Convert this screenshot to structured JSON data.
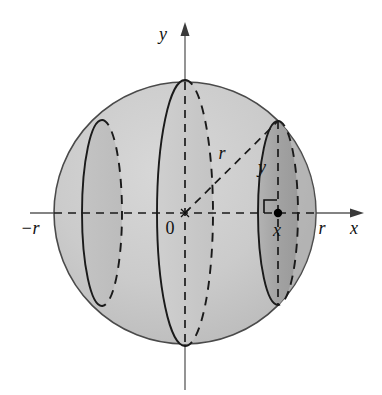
{
  "figure": {
    "type": "geometric-diagram",
    "background_color": "#ffffff",
    "sphere": {
      "center_label": "0",
      "fill_color": "#c9c9c9",
      "fill_color_dark": "#9e9e9e",
      "outline_color": "#4a4a4a",
      "center_x": 185,
      "center_y": 213,
      "radius": 131
    },
    "axes": {
      "x_axis": {
        "label": "x",
        "color": "#5a5a5a",
        "arrow": "right",
        "y": 213,
        "start_x": 30,
        "end_x": 364
      },
      "y_axis": {
        "label": "y",
        "color": "#5a5a5a",
        "arrow": "up",
        "x": 185,
        "start_y": 390,
        "end_y": 22
      }
    },
    "tick_labels": [
      {
        "name": "neg-r",
        "text": "−r",
        "x": 30,
        "y": 234
      },
      {
        "name": "origin",
        "text": "0",
        "x": 167,
        "y": 233
      },
      {
        "name": "pos-r",
        "text": "r",
        "x": 322,
        "y": 234
      }
    ],
    "annotations": [
      {
        "name": "radius-label",
        "text": "r",
        "x": 222,
        "y": 159
      },
      {
        "name": "y-height-label",
        "text": "y",
        "x": 262,
        "y": 173
      },
      {
        "name": "x-position-label",
        "text": "x",
        "x": 274,
        "y": 234
      },
      {
        "name": "x-axis-label",
        "text": "x",
        "x": 354,
        "y": 234
      },
      {
        "name": "y-axis-label",
        "text": "y",
        "x": 163,
        "y": 40
      }
    ],
    "radius_segment": {
      "from": {
        "x": 185,
        "y": 213
      },
      "to": {
        "x": 278,
        "y": 121
      },
      "style": "dashed"
    },
    "cross_sections": [
      {
        "name": "left-disk",
        "center_x": 102,
        "center_y": 213,
        "rx": 20,
        "ry": 93,
        "shading": "#bdbdbd"
      },
      {
        "name": "center-disk",
        "center_x": 185,
        "center_y": 213,
        "rx": 28,
        "ry": 133,
        "shading": "#c5c5c5"
      },
      {
        "name": "right-disk",
        "center_x": 278,
        "center_y": 213,
        "rx": 20,
        "ry": 92,
        "shading": "#a5a5a5"
      }
    ],
    "point_marker": {
      "name": "sample-point",
      "x": 278,
      "y": 213,
      "radius": 4
    },
    "right_angle_marker": {
      "x": 263,
      "y": 200,
      "size": 13
    }
  }
}
